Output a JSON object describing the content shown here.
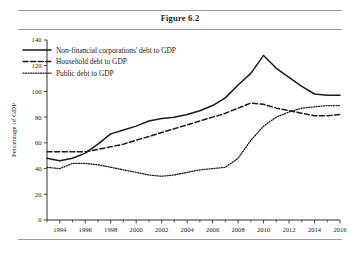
{
  "figure": {
    "title": "Figure 6.2"
  },
  "chart_data": {
    "type": "line",
    "title": "Figure 6.2",
    "xlabel": "",
    "ylabel": "Percentage of GDP",
    "xlim": [
      1993,
      2016
    ],
    "ylim": [
      0,
      140
    ],
    "yticks": [
      0,
      20,
      40,
      60,
      80,
      100,
      120,
      140
    ],
    "xticks": [
      1994,
      1996,
      1998,
      2000,
      2002,
      2004,
      2006,
      2008,
      2010,
      2012,
      2014,
      2016
    ],
    "xticks_minor": [
      1993,
      1995,
      1997,
      1999,
      2001,
      2003,
      2005,
      2007,
      2009,
      2011,
      2013,
      2015
    ],
    "grid": false,
    "legend_position": "top-left",
    "x": [
      1993,
      1994,
      1995,
      1996,
      1997,
      1998,
      1999,
      2000,
      2001,
      2002,
      2003,
      2004,
      2005,
      2006,
      2007,
      2008,
      2009,
      2010,
      2011,
      2012,
      2013,
      2014,
      2015,
      2016
    ],
    "series": [
      {
        "name": "Non-financial corporations' debt to GDP",
        "style": "solid",
        "values": [
          48,
          46,
          48,
          52,
          59,
          67,
          70,
          73,
          77,
          79,
          80,
          82,
          85,
          89,
          95,
          105,
          114,
          128,
          118,
          111,
          104,
          98,
          97,
          97
        ]
      },
      {
        "name": "Household debt to GDP",
        "style": "dashed",
        "values": [
          53,
          53,
          53,
          53,
          55,
          57,
          59,
          62,
          65,
          68,
          71,
          74,
          77,
          80,
          83,
          87,
          91,
          90,
          87,
          85,
          83,
          81,
          81,
          82
        ]
      },
      {
        "name": "Public debt to GDP",
        "style": "dotted",
        "values": [
          41,
          40,
          44,
          44,
          43,
          41,
          39,
          37,
          35,
          34,
          35,
          37,
          39,
          40,
          41,
          48,
          62,
          73,
          80,
          84,
          87,
          88,
          89,
          89
        ]
      }
    ]
  },
  "axis": {
    "y_label": "Percentage of GDP",
    "y_tick_labels": [
      "0",
      "20",
      "40",
      "60",
      "80",
      "100",
      "120",
      "140"
    ],
    "x_tick_labels": [
      "1994",
      "1996",
      "1998",
      "2000",
      "2002",
      "2004",
      "2006",
      "2008",
      "2010",
      "2012",
      "2014",
      "2016"
    ]
  },
  "legend": {
    "items": [
      {
        "label": "Non-financial corporations' debt to GDP",
        "style": "solid"
      },
      {
        "label": "Household debt to GDP",
        "style": "dashed"
      },
      {
        "label": "Public debt to GDP",
        "style": "dotted"
      }
    ]
  }
}
